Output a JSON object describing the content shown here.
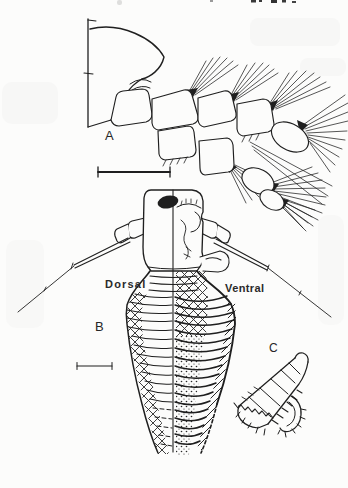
{
  "figure": {
    "panels": {
      "a": {
        "label": "A"
      },
      "b": {
        "label": "B",
        "dorsal": "Dorsal",
        "ventral": "Ventral"
      },
      "c": {
        "label": "C"
      }
    }
  },
  "colors": {
    "ink": "#1f1f1f",
    "paper": "#fcfcfb"
  }
}
